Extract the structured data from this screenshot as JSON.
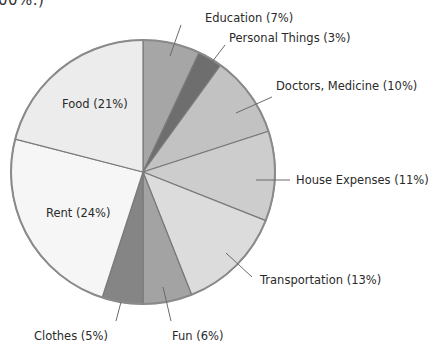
{
  "header_fragment": "00%.)",
  "chart_data": {
    "type": "pie",
    "title": "",
    "start_angle_deg": 0,
    "direction": "clockwise",
    "center": [
      143,
      172
    ],
    "radius": 132,
    "slices": [
      {
        "label": "Education (7%)",
        "name": "Education",
        "value": 7,
        "color": "#a6a6a6"
      },
      {
        "label": "Personal Things (3%)",
        "name": "Personal Things",
        "value": 3,
        "color": "#6e6e6e"
      },
      {
        "label": "Doctors, Medicine (10%)",
        "name": "Doctors, Medicine",
        "value": 10,
        "color": "#c2c2c2"
      },
      {
        "label": "House Expenses (11%)",
        "name": "House Expenses",
        "value": 11,
        "color": "#cdcdcd"
      },
      {
        "label": "Transportation (13%)",
        "name": "Transportation",
        "value": 13,
        "color": "#dcdcdc"
      },
      {
        "label": "Fun (6%)",
        "name": "Fun",
        "value": 6,
        "color": "#a3a3a3"
      },
      {
        "label": "Clothes (5%)",
        "name": "Clothes",
        "value": 5,
        "color": "#858585"
      },
      {
        "label": "Rent (24%)",
        "name": "Rent",
        "value": 24,
        "color": "#f6f6f6"
      },
      {
        "label": "Food (21%)",
        "name": "Food",
        "value": 21,
        "color": "#ececec"
      }
    ],
    "labels": [
      {
        "text": "Education (7%)",
        "x": 205,
        "y": 22,
        "anchor": "start",
        "leader": [
          [
            181,
            25
          ],
          [
            170,
            56
          ]
        ]
      },
      {
        "text": "Personal Things (3%)",
        "x": 229,
        "y": 42,
        "anchor": "start",
        "leader": [
          [
            225,
            45
          ],
          [
            212,
            62
          ]
        ]
      },
      {
        "text": "Doctors, Medicine (10%)",
        "x": 276,
        "y": 90,
        "anchor": "start",
        "leader": [
          [
            272,
            97
          ],
          [
            236,
            113
          ]
        ]
      },
      {
        "text": "House Expenses (11%)",
        "x": 296,
        "y": 184,
        "anchor": "start",
        "leader": [
          [
            290,
            180
          ],
          [
            256,
            180
          ]
        ]
      },
      {
        "text": "Transportation (13%)",
        "x": 260,
        "y": 284,
        "anchor": "start",
        "leader": [
          [
            252,
            277
          ],
          [
            226,
            253
          ]
        ]
      },
      {
        "text": "Fun (6%)",
        "x": 172,
        "y": 340,
        "anchor": "start",
        "leader": [
          [
            171,
            321
          ],
          [
            163,
            287
          ]
        ]
      },
      {
        "text": "Clothes (5%)",
        "x": 108,
        "y": 340,
        "anchor": "end",
        "leader": [
          [
            116,
            321
          ],
          [
            121,
            302
          ]
        ]
      },
      {
        "text": "Rent (24%)",
        "x": 46,
        "y": 217,
        "anchor": "start",
        "leader": null
      },
      {
        "text": "Food (21%)",
        "x": 62,
        "y": 108,
        "anchor": "start",
        "leader": null
      }
    ],
    "outline_color": "#8a8a8a",
    "divider_color": "#7a7a7a"
  }
}
